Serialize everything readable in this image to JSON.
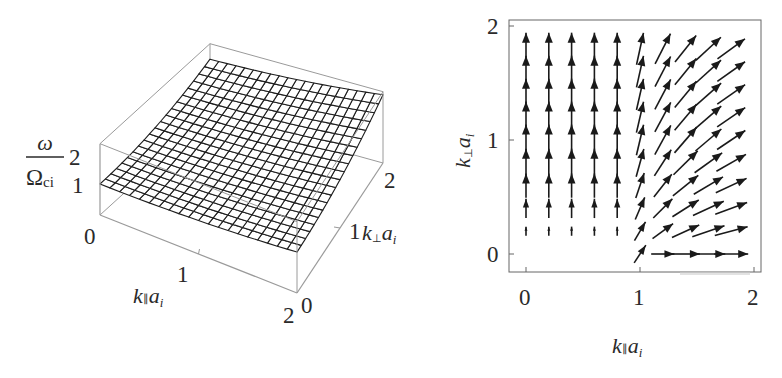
{
  "figure": {
    "panels": [
      "surface-3d",
      "vector-field"
    ]
  },
  "chart_data": [
    {
      "type": "surface3d",
      "title": "",
      "xlabel": "k∥ a_i",
      "ylabel": "k⊥ a_i",
      "zlabel": "ω / Ω_ci",
      "x_ticks": [
        "0",
        "1",
        "2"
      ],
      "y_ticks": [
        "0",
        "1",
        "2"
      ],
      "z_ticks": [
        "0",
        "1",
        "2"
      ],
      "xlim": [
        0,
        2
      ],
      "ylim": [
        0,
        2
      ],
      "zlim": [
        0,
        2.3
      ],
      "grid_resolution": 20,
      "description": "Wireframe surface of normalized frequency; ~1 at k∥a_i=0, k⊥a_i=0, rising toward ~2 at large k∥ and k⊥",
      "sample_values": [
        {
          "kpar": 0,
          "kperp": 0,
          "omega": 1.0
        },
        {
          "kpar": 2,
          "kperp": 0,
          "omega": 1.15
        },
        {
          "kpar": 0,
          "kperp": 2,
          "omega": 1.9
        },
        {
          "kpar": 2,
          "kperp": 2,
          "omega": 2.2
        }
      ]
    },
    {
      "type": "vector-field",
      "title": "",
      "xlabel": "k∥ a_i",
      "ylabel": "k⊥ a_i",
      "x_ticks": [
        "0",
        "1",
        "2"
      ],
      "y_ticks": [
        "0",
        "1",
        "2"
      ],
      "xlim": [
        -0.15,
        2.05
      ],
      "ylim": [
        -0.15,
        2.05
      ],
      "grid_x": [
        0,
        0.2,
        0.4,
        0.6,
        0.8,
        1.0,
        1.2,
        1.4,
        1.6,
        1.8
      ],
      "grid_y": [
        0,
        0.2,
        0.4,
        0.6,
        0.8,
        1.0,
        1.2,
        1.4,
        1.6,
        1.8
      ],
      "description": "Arrows (group-velocity-like gradient) point vertically for small k∥, rotate toward horizontal for large k∥ and small k⊥; near-zero magnitude at small k∥, small k⊥"
    }
  ],
  "left_panel": {
    "zlabel_num": "ω",
    "zlabel_den": "Ω",
    "zlabel_den_sub": "ci",
    "z_ticks": [
      "0",
      "1",
      "2"
    ],
    "x_ticks": [
      "1",
      "2"
    ],
    "y_ticks": [
      "0",
      "1",
      "2"
    ],
    "xlabel_k": "k",
    "xlabel_par": "∥",
    "xlabel_a": "a",
    "xlabel_i": "i",
    "ylabel_k": "k",
    "ylabel_perp": "⊥",
    "ylabel_a": "a",
    "ylabel_i": "i"
  },
  "right_panel": {
    "x_ticks": [
      "0",
      "1",
      "2"
    ],
    "y_ticks": [
      "0",
      "1",
      "2"
    ],
    "xlabel_k": "k",
    "xlabel_par": "∥",
    "xlabel_a": "a",
    "xlabel_i": "i",
    "ylabel_k": "k",
    "ylabel_perp": "⊥",
    "ylabel_a": "a",
    "ylabel_i": "i"
  },
  "colors": {
    "mesh": "#1e1e1e",
    "box": "#9a9a9a",
    "frame": "#555555",
    "arrow": "#1a1a1a"
  }
}
